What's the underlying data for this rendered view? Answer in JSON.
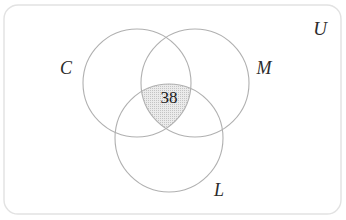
{
  "diagram": {
    "type": "venn-3-set",
    "title_visible": false,
    "universe": {
      "label": "U",
      "shape": "rounded-rectangle",
      "border_color": "#e2e2e2",
      "fill_color": "#ffffff",
      "x": 4,
      "y": 5,
      "width": 337,
      "height": 209,
      "corner_radius": 14,
      "label_x": 320,
      "label_y": 35,
      "label_size": 19
    },
    "circles": [
      {
        "id": "C",
        "label": "C",
        "cx": 137,
        "cy": 83,
        "r": 54,
        "stroke": "#b0b0b0",
        "fill": "none",
        "label_x": 66,
        "label_y": 74,
        "label_size": 18
      },
      {
        "id": "M",
        "label": "M",
        "cx": 195,
        "cy": 83,
        "r": 54,
        "stroke": "#b0b0b0",
        "fill": "none",
        "label_x": 264,
        "label_y": 74,
        "label_size": 18
      },
      {
        "id": "L",
        "label": "L",
        "cx": 169,
        "cy": 138,
        "r": 54,
        "stroke": "#b0b0b0",
        "fill": "none",
        "label_x": 219,
        "label_y": 196,
        "label_size": 18
      }
    ],
    "regions": [
      {
        "id": "C-and-M-and-L",
        "description": "intersection of all three sets",
        "value": "38",
        "shaded": true,
        "fill_color": "#e0e0e0",
        "pattern": "fine-dotted",
        "label_x": 169,
        "label_y": 103,
        "label_size": 17
      }
    ],
    "colors": {
      "circle_stroke": "#b0b0b0",
      "universe_stroke": "#e2e2e2",
      "shade_fill": "#e0e0e0",
      "text": "#2b2b2b",
      "count_text": "#1a1a1a",
      "background": "#ffffff"
    }
  }
}
